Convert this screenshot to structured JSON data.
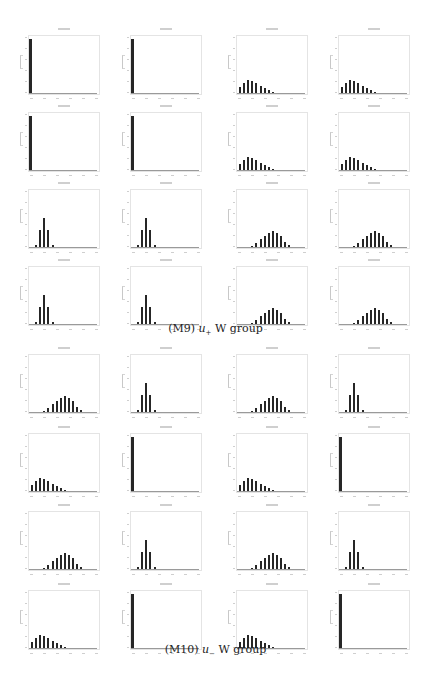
{
  "figures": [
    {
      "id": "M9",
      "caption_label": "(M9)",
      "caption_var": "u",
      "caption_sub": "+",
      "caption_rest": "W group",
      "rows": [
        [
          "spike",
          "spike",
          "right",
          "right"
        ],
        [
          "spike",
          "spike",
          "right",
          "right"
        ],
        [
          "narrow",
          "narrow",
          "center",
          "center"
        ],
        [
          "narrow",
          "narrow",
          "center",
          "center"
        ]
      ]
    },
    {
      "id": "M10",
      "caption_label": "(M10)",
      "caption_var": "u",
      "caption_sub": "−",
      "caption_rest": "W group",
      "rows": [
        [
          "center",
          "narrow",
          "center",
          "narrow"
        ],
        [
          "right",
          "spike",
          "right",
          "spike"
        ],
        [
          "center",
          "narrow",
          "center",
          "narrow"
        ],
        [
          "right",
          "spike",
          "right",
          "spike"
        ]
      ]
    }
  ],
  "chart_data": {
    "type": "bar",
    "xlabel": "",
    "ylabel": "",
    "grid": false,
    "panel_shapes": {
      "spike": {
        "categories": [
          1,
          2,
          3,
          4,
          5,
          6,
          7,
          8,
          9,
          10,
          11,
          12,
          13,
          14,
          15,
          16
        ],
        "values": [
          100,
          0,
          0,
          0,
          0,
          0,
          0,
          0,
          0,
          0,
          0,
          0,
          0,
          0,
          0,
          0
        ]
      },
      "right": {
        "categories": [
          1,
          2,
          3,
          4,
          5,
          6,
          7,
          8,
          9,
          10,
          11,
          12,
          13,
          14,
          15,
          16
        ],
        "values": [
          7,
          12,
          15,
          14,
          12,
          9,
          6,
          4,
          2,
          1.5,
          1,
          0.8,
          0.5,
          0.3,
          0.2,
          0.1
        ]
      },
      "narrow": {
        "categories": [
          1,
          2,
          3,
          4,
          5,
          6,
          7,
          8,
          9,
          10,
          11,
          12,
          13,
          14,
          15,
          16
        ],
        "values": [
          1,
          4,
          28,
          48,
          28,
          4,
          1,
          0.5,
          0.2,
          0,
          0,
          0,
          0,
          0,
          0,
          0
        ]
      },
      "center": {
        "categories": [
          1,
          2,
          3,
          4,
          5,
          6,
          7,
          8,
          9,
          10,
          11,
          12,
          13,
          14,
          15,
          16
        ],
        "values": [
          0.5,
          0.8,
          1.5,
          3,
          6,
          11,
          16,
          20,
          22,
          20,
          15,
          8,
          4,
          1.5,
          1,
          0.5
        ]
      }
    }
  }
}
